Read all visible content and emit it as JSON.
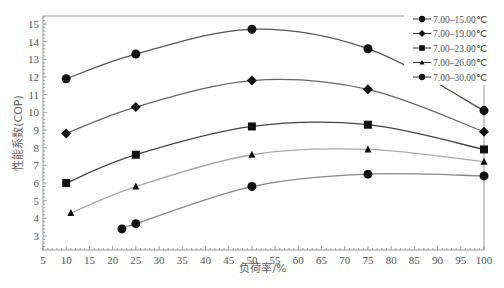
{
  "chart_data": {
    "type": "line",
    "title": "",
    "xlabel": "负荷率/%",
    "ylabel": "性能系数(COP)",
    "xlim": [
      5,
      100
    ],
    "ylim": [
      2.25,
      15.5
    ],
    "xticks": [
      5,
      10,
      15,
      20,
      25,
      30,
      35,
      40,
      45,
      50,
      55,
      60,
      65,
      70,
      75,
      80,
      85,
      90,
      95,
      100
    ],
    "yticks": [
      3,
      4,
      5,
      6,
      7,
      8,
      9,
      10,
      11,
      12,
      13,
      14,
      15
    ],
    "grid": false,
    "legend_position": "upper right",
    "series": [
      {
        "name": "7.00–15.00℃",
        "marker": "circle",
        "color": "#555555",
        "x": [
          10,
          25,
          50,
          75,
          100
        ],
        "y": [
          11.9,
          13.3,
          14.7,
          13.6,
          10.1
        ]
      },
      {
        "name": "7.00–19.00℃",
        "marker": "diamond",
        "color": "#666666",
        "x": [
          10,
          25,
          50,
          75,
          100
        ],
        "y": [
          8.8,
          10.3,
          11.8,
          11.3,
          8.9
        ]
      },
      {
        "name": "7.00–23.00℃",
        "marker": "square",
        "color": "#444444",
        "x": [
          10,
          25,
          50,
          75,
          100
        ],
        "y": [
          6.0,
          7.6,
          9.2,
          9.3,
          7.9
        ]
      },
      {
        "name": "7.00–26.00℃",
        "marker": "triangle",
        "color": "#aaaaaa",
        "x": [
          11,
          25,
          50,
          75,
          100
        ],
        "y": [
          4.3,
          5.8,
          7.6,
          7.9,
          7.2
        ]
      },
      {
        "name": "7.00–30.00℃",
        "marker": "circle",
        "color": "#888888",
        "x": [
          22,
          25,
          50,
          75,
          100
        ],
        "y": [
          3.4,
          3.7,
          5.8,
          6.5,
          6.4
        ]
      }
    ]
  }
}
